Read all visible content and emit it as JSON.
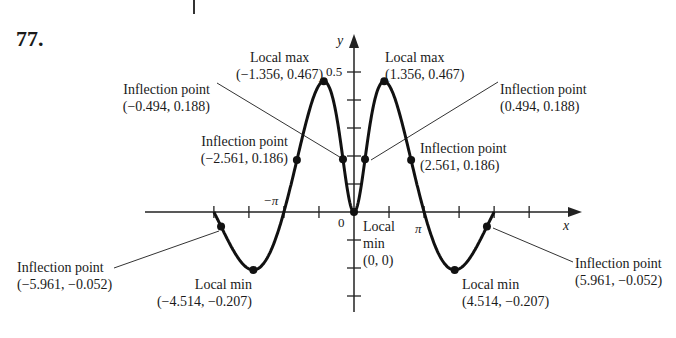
{
  "problem": {
    "number": "77."
  },
  "axes": {
    "x_label": "x",
    "y_label": "y",
    "origin_label": "0",
    "y_tick_label": "0.5",
    "x_tick_label_neg": "−π",
    "x_tick_label_pos": "π"
  },
  "annotations": {
    "local_max_left": {
      "title": "Local max",
      "coords": "(−1.356, 0.467)"
    },
    "local_max_right": {
      "title": "Local max",
      "coords": "(1.356, 0.467)"
    },
    "inflection_upper_left": {
      "title": "Inflection point",
      "coords": "(−0.494, 0.188)"
    },
    "inflection_upper_right": {
      "title": "Inflection point",
      "coords": "(0.494, 0.188)"
    },
    "inflection_mid_left": {
      "title": "Inflection point",
      "coords": "(−2.561, 0.186)"
    },
    "inflection_mid_right": {
      "title": "Inflection point",
      "coords": "(2.561, 0.186)"
    },
    "inflection_low_left": {
      "title": "Inflection point",
      "coords": "(−5.961, −0.052)"
    },
    "inflection_low_right": {
      "title": "Inflection point",
      "coords": "(5.961, −0.052)"
    },
    "local_min_left": {
      "title": "Local min",
      "coords": "(−4.514, −0.207)"
    },
    "local_min_right": {
      "title": "Local min",
      "coords": "(4.514, −0.207)"
    },
    "local_min_origin": {
      "line1": "Local",
      "line2": "min",
      "line3": "(0, 0)"
    }
  },
  "chart_data": {
    "type": "line",
    "title": "77.",
    "xlabel": "x",
    "ylabel": "y",
    "function_shape": "even function, zero at x=0 and x=±π, domain [−2π, 2π]",
    "xlim": [
      -6.283,
      6.283
    ],
    "ylim": [
      -0.3,
      0.55
    ],
    "x_ticks": [
      "−2π",
      "−3π/2",
      "−π",
      "−π/2",
      "0",
      "π/2",
      "π",
      "3π/2",
      "2π"
    ],
    "x_tick_labels_shown": [
      "−π",
      "0",
      "π"
    ],
    "y_ticks": [
      -0.3,
      -0.2,
      -0.1,
      0.1,
      0.2,
      0.3,
      0.4,
      0.5
    ],
    "y_tick_labels_shown": [
      "0.5"
    ],
    "grid": false,
    "key_points": [
      {
        "label": "Local max",
        "x": -1.356,
        "y": 0.467
      },
      {
        "label": "Local max",
        "x": 1.356,
        "y": 0.467
      },
      {
        "label": "Local min",
        "x": 0,
        "y": 0
      },
      {
        "label": "Local min",
        "x": -4.514,
        "y": -0.207
      },
      {
        "label": "Local min",
        "x": 4.514,
        "y": -0.207
      },
      {
        "label": "Inflection point",
        "x": -0.494,
        "y": 0.188
      },
      {
        "label": "Inflection point",
        "x": 0.494,
        "y": 0.188
      },
      {
        "label": "Inflection point",
        "x": -2.561,
        "y": 0.186
      },
      {
        "label": "Inflection point",
        "x": 2.561,
        "y": 0.186
      },
      {
        "label": "Inflection point",
        "x": -5.961,
        "y": -0.052
      },
      {
        "label": "Inflection point",
        "x": 5.961,
        "y": -0.052
      }
    ]
  }
}
